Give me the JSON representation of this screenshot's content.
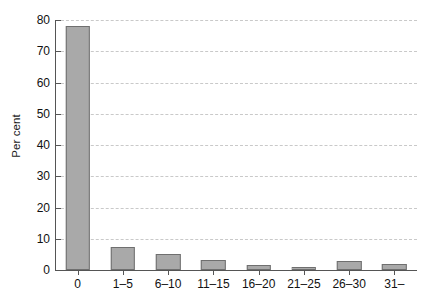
{
  "chart_data": {
    "type": "bar",
    "title": "",
    "subtitle": "",
    "xlabel": "",
    "ylabel": "Per cent",
    "categories": [
      "0",
      "1–5",
      "6–10",
      "11–15",
      "16–20",
      "21–25",
      "26–30",
      "31–"
    ],
    "values": [
      78,
      7.5,
      5.2,
      3.3,
      1.5,
      1.0,
      3.0,
      2.0
    ],
    "ylim": [
      0,
      80
    ],
    "ytick_values": [
      0,
      10,
      20,
      30,
      40,
      50,
      60,
      70,
      80
    ],
    "ytick_labels": [
      "0",
      "10",
      "20",
      "30",
      "40",
      "50",
      "60",
      "70",
      "80"
    ],
    "grid": "horizontal-dashed",
    "legend": null,
    "legend_position": "none",
    "bar_color": "#a9a9a9",
    "bar_edge_color": "#6f6f6f",
    "grid_color": "#c9c9c9",
    "axis_color": "#555555",
    "background_color": "#ffffff"
  }
}
